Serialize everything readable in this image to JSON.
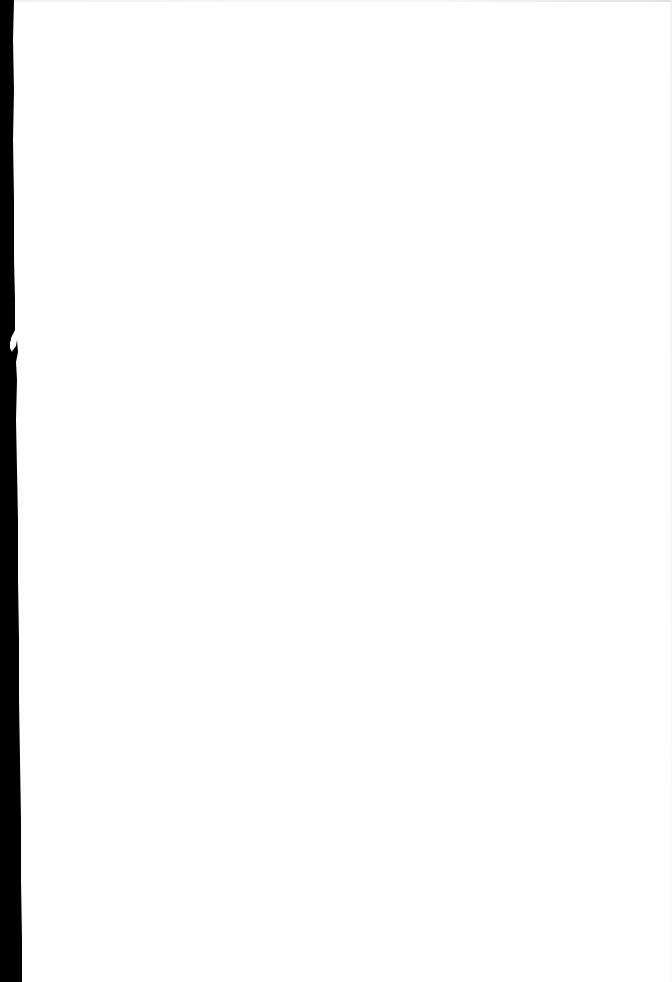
{
  "document": {
    "type": "scanned-page",
    "content": "",
    "colors": {
      "paper": "#fefefe",
      "scanner_edge": "#000000"
    }
  }
}
